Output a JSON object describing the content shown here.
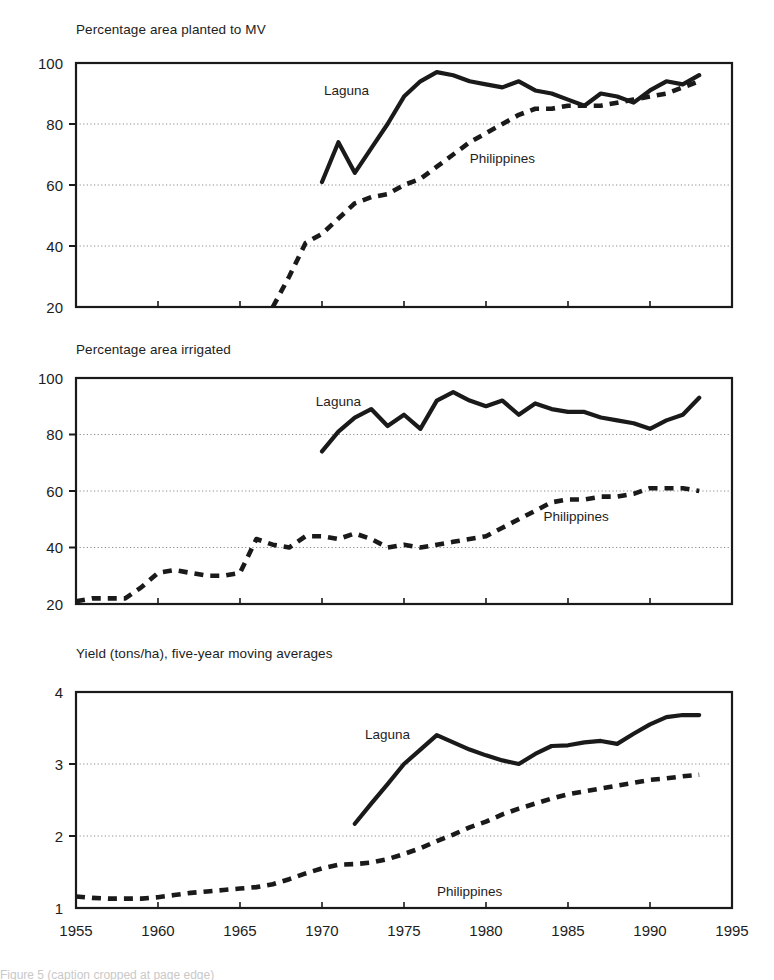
{
  "figure": {
    "width": 774,
    "height": 980,
    "background": "#ffffff",
    "ink_color": "#1a1a1a",
    "gridline_color": "#8c8c8c",
    "axis_color": "#1a1a1a",
    "caption_fragment": "Figure 5 (caption cropped at page edge)"
  },
  "xaxis": {
    "label_text": "",
    "min": 1955,
    "max": 1995,
    "tick_values": [
      1955,
      1960,
      1965,
      1970,
      1975,
      1980,
      1985,
      1990,
      1995
    ],
    "tick_labels": [
      "1955",
      "1960",
      "1965",
      "1970",
      "1975",
      "1980",
      "1985",
      "1990",
      "1995"
    ],
    "minor_tick_step": 5
  },
  "legend": {
    "laguna_label": "Laguna",
    "philippines_label": "Philippines",
    "laguna_style": "solid-thick",
    "philippines_style": "dashed-thick"
  },
  "panels": [
    {
      "id": "panel-mv",
      "title": "Percentage area planted to MV",
      "ylabel": "",
      "ylim": [
        20,
        100
      ],
      "yticks": [
        20,
        40,
        60,
        80,
        100
      ],
      "ytick_labels": [
        "20",
        "40",
        "60",
        "80",
        "100"
      ],
      "grid_at": [
        40,
        60,
        80
      ],
      "laguna_label_x": 1971.5,
      "laguna_label_y": 91,
      "philippines_label_x": 1981.0,
      "philippines_label_y": 69
    },
    {
      "id": "panel-irrigated",
      "title": "Percentage area irrigated",
      "ylabel": "",
      "ylim": [
        20,
        100
      ],
      "yticks": [
        20,
        40,
        60,
        80,
        100
      ],
      "ytick_labels": [
        "20",
        "40",
        "60",
        "80",
        "100"
      ],
      "grid_at": [
        40,
        60,
        80
      ],
      "laguna_label_x": 1971.0,
      "laguna_label_y": 92,
      "philippines_label_x": 1985.5,
      "philippines_label_y": 51
    },
    {
      "id": "panel-yield",
      "title": "Yield (tons/ha), five-year moving averages",
      "ylabel": "",
      "ylim": [
        1,
        4
      ],
      "yticks": [
        1,
        2,
        3,
        4
      ],
      "ytick_labels": [
        "1",
        "2",
        "3",
        "4"
      ],
      "grid_at": [
        2,
        3
      ],
      "laguna_label_x": 1974.0,
      "laguna_label_y": 3.42,
      "philippines_label_x": 1979.0,
      "philippines_label_y": 1.23
    }
  ],
  "chart_data": [
    {
      "type": "line",
      "title": "Percentage area planted to MV",
      "xlabel": "",
      "ylabel": "Percentage area planted to MV",
      "xlim": [
        1955,
        1995
      ],
      "ylim": [
        20,
        100
      ],
      "grid": true,
      "legend_position": "inline-annotation",
      "series": [
        {
          "name": "Laguna",
          "style": "solid",
          "x": [
            1970,
            1971,
            1972,
            1973,
            1974,
            1975,
            1976,
            1977,
            1978,
            1979,
            1980,
            1981,
            1982,
            1983,
            1984,
            1985,
            1986,
            1987,
            1988,
            1989,
            1990,
            1991,
            1992,
            1993
          ],
          "y": [
            61,
            74,
            64,
            72,
            80,
            89,
            94,
            97,
            96,
            94,
            93,
            92,
            94,
            91,
            90,
            88,
            86,
            90,
            89,
            87,
            91,
            94,
            93,
            96
          ]
        },
        {
          "name": "Philippines",
          "style": "dashed",
          "x": [
            1967,
            1968,
            1969,
            1970,
            1971,
            1972,
            1973,
            1974,
            1975,
            1976,
            1977,
            1978,
            1979,
            1980,
            1981,
            1982,
            1983,
            1984,
            1985,
            1986,
            1987,
            1988,
            1989,
            1990,
            1991,
            1992,
            1993
          ],
          "y": [
            20,
            30,
            41,
            44,
            49,
            54,
            56,
            57,
            60,
            62,
            66,
            70,
            74,
            77,
            80,
            83,
            85,
            85,
            86,
            86,
            86,
            87,
            88,
            89,
            90,
            92,
            94
          ]
        }
      ]
    },
    {
      "type": "line",
      "title": "Percentage area irrigated",
      "xlabel": "",
      "ylabel": "Percentage area irrigated",
      "xlim": [
        1955,
        1995
      ],
      "ylim": [
        20,
        100
      ],
      "grid": true,
      "legend_position": "inline-annotation",
      "series": [
        {
          "name": "Laguna",
          "style": "solid",
          "x": [
            1970,
            1971,
            1972,
            1973,
            1974,
            1975,
            1976,
            1977,
            1978,
            1979,
            1980,
            1981,
            1982,
            1983,
            1984,
            1985,
            1986,
            1987,
            1988,
            1989,
            1990,
            1991,
            1992,
            1993
          ],
          "y": [
            74,
            81,
            86,
            89,
            83,
            87,
            82,
            92,
            95,
            92,
            90,
            92,
            87,
            91,
            89,
            88,
            88,
            86,
            85,
            84,
            82,
            85,
            87,
            93
          ]
        },
        {
          "name": "Philippines",
          "style": "dashed",
          "x": [
            1955,
            1956,
            1957,
            1958,
            1959,
            1960,
            1961,
            1962,
            1963,
            1964,
            1965,
            1966,
            1967,
            1968,
            1969,
            1970,
            1971,
            1972,
            1973,
            1974,
            1975,
            1976,
            1977,
            1978,
            1979,
            1980,
            1981,
            1982,
            1983,
            1984,
            1985,
            1986,
            1987,
            1988,
            1989,
            1990,
            1991,
            1992,
            1993
          ],
          "y": [
            21,
            22,
            22,
            22,
            26,
            31,
            32,
            31,
            30,
            30,
            31,
            43,
            41,
            40,
            44,
            44,
            43,
            45,
            43,
            40,
            41,
            40,
            41,
            42,
            43,
            44,
            47,
            50,
            53,
            56,
            57,
            57,
            58,
            58,
            59,
            61,
            61,
            61,
            60
          ]
        }
      ]
    },
    {
      "type": "line",
      "title": "Yield (tons/ha), five-year moving averages",
      "xlabel": "",
      "ylabel": "Yield (tons/ha)",
      "xlim": [
        1955,
        1995
      ],
      "ylim": [
        1,
        4
      ],
      "grid": true,
      "legend_position": "inline-annotation",
      "series": [
        {
          "name": "Laguna",
          "style": "solid",
          "x": [
            1972,
            1973,
            1974,
            1975,
            1976,
            1977,
            1978,
            1979,
            1980,
            1981,
            1982,
            1983,
            1984,
            1985,
            1986,
            1987,
            1988,
            1989,
            1990,
            1991,
            1992,
            1993
          ],
          "y": [
            2.17,
            2.45,
            2.72,
            3.0,
            3.2,
            3.4,
            3.3,
            3.2,
            3.12,
            3.05,
            3.0,
            3.14,
            3.25,
            3.26,
            3.3,
            3.32,
            3.28,
            3.42,
            3.55,
            3.65,
            3.68,
            3.68
          ]
        },
        {
          "name": "Philippines",
          "style": "dashed",
          "x": [
            1955,
            1956,
            1957,
            1958,
            1959,
            1960,
            1961,
            1962,
            1963,
            1964,
            1965,
            1966,
            1967,
            1968,
            1969,
            1970,
            1971,
            1972,
            1973,
            1974,
            1975,
            1976,
            1977,
            1978,
            1979,
            1980,
            1981,
            1982,
            1983,
            1984,
            1985,
            1986,
            1987,
            1988,
            1989,
            1990,
            1991,
            1992,
            1993
          ],
          "y": [
            1.16,
            1.14,
            1.13,
            1.13,
            1.13,
            1.15,
            1.18,
            1.21,
            1.23,
            1.25,
            1.27,
            1.29,
            1.33,
            1.4,
            1.48,
            1.55,
            1.6,
            1.61,
            1.63,
            1.68,
            1.75,
            1.83,
            1.93,
            2.02,
            2.12,
            2.2,
            2.3,
            2.38,
            2.45,
            2.52,
            2.58,
            2.62,
            2.66,
            2.7,
            2.74,
            2.78,
            2.8,
            2.83,
            2.85
          ]
        }
      ]
    }
  ]
}
